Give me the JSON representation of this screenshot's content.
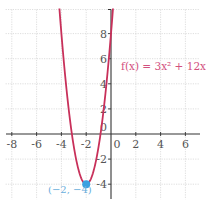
{
  "chart_data": {
    "type": "line",
    "title": "",
    "xlabel": "",
    "ylabel": "",
    "xlim": [
      -8.5,
      7.2
    ],
    "ylim": [
      -5.2,
      10
    ],
    "grid": true,
    "x_ticks": [
      -8,
      -6,
      -4,
      -2,
      0,
      2,
      4,
      6
    ],
    "y_ticks": [
      8,
      6,
      4,
      2,
      0,
      -2,
      -4
    ],
    "x_tick_labels": [
      "-8",
      "-6",
      "-4",
      "-2",
      "0",
      "2",
      "4",
      "6"
    ],
    "y_tick_labels": [
      "8",
      "6",
      "4",
      "2",
      "0",
      "-2",
      "-4"
    ],
    "series": [
      {
        "name": "f(x) = 3x² + 12x + 8",
        "function": "3x^2 + 12x + 8",
        "color": "#c8305a",
        "x_range": [
          -4.16,
          0.16
        ]
      }
    ],
    "annotations": [
      {
        "text": "f(x) = 3x² + 12x + 8",
        "x": 0.7,
        "y": 5.8,
        "color": "#d2507e"
      },
      {
        "text": "(−2, −4)",
        "x": -2,
        "y": -4,
        "color": "#6aaedc",
        "marker": "point",
        "marker_color": "#3aa0e0"
      }
    ],
    "vertex": {
      "x": -2,
      "y": -4
    }
  },
  "labels": {
    "function": "f(x) = 3x² + 12x + 8",
    "vertex": "(−2, −4)"
  },
  "colors": {
    "curve": "#c8305a",
    "function_label": "#d2507e",
    "vertex_point": "#3aa0e0",
    "vertex_label": "#6aaedc",
    "axis": "#333333",
    "grid": "#c8c8c8"
  }
}
